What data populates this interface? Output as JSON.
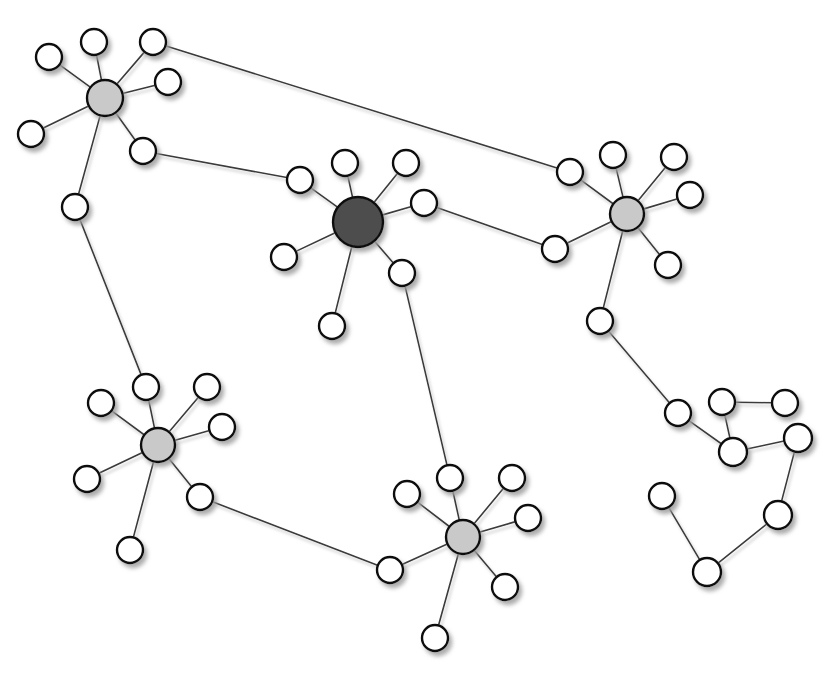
{
  "figure": {
    "background_color": "#ffffff",
    "width": 838,
    "height": 682
  },
  "style": {
    "edge_color": "#3a3a3a",
    "edge_width": 1.6,
    "node_stroke_color": "#111111",
    "node_stroke_width": 2.4,
    "leaf_fill": "#ffffff",
    "hub_light_fill": "#c9c9c9",
    "hub_dark_fill": "#4d4d4d",
    "shadow_color": "#bdbdbd"
  },
  "chart_data": {
    "type": "scatter",
    "xlabel": "",
    "ylabel": "",
    "xlim": [
      0,
      838
    ],
    "ylim": [
      0,
      682
    ],
    "grid": false,
    "legend": "none",
    "node_count": 57,
    "edge_count": 61,
    "node_classes": [
      {
        "name": "hub-dark",
        "count": 1,
        "radius": 25,
        "fill": "#4d4d4d"
      },
      {
        "name": "hub-light",
        "count": 4,
        "radius": 17,
        "fill": "#c9c9c9"
      },
      {
        "name": "leaf",
        "count": 52,
        "radius": 13,
        "fill": "#ffffff"
      }
    ],
    "nodes": [
      {
        "id": "h1",
        "label": "hub-top-left",
        "x": 105,
        "y": 98,
        "r": 18,
        "class": "hub-light"
      },
      {
        "id": "h1a",
        "label": "leaf",
        "x": 94,
        "y": 42,
        "r": 13,
        "class": "leaf"
      },
      {
        "id": "h1b",
        "label": "leaf",
        "x": 49,
        "y": 57,
        "r": 13,
        "class": "leaf"
      },
      {
        "id": "h1c",
        "label": "leaf",
        "x": 153,
        "y": 42,
        "r": 13,
        "class": "leaf"
      },
      {
        "id": "h1d",
        "label": "leaf",
        "x": 168,
        "y": 82,
        "r": 13,
        "class": "leaf"
      },
      {
        "id": "h1e",
        "label": "leaf",
        "x": 31,
        "y": 134,
        "r": 13,
        "class": "leaf"
      },
      {
        "id": "h1f",
        "label": "leaf",
        "x": 143,
        "y": 151,
        "r": 13,
        "class": "leaf"
      },
      {
        "id": "h1g",
        "label": "leaf",
        "x": 75,
        "y": 207,
        "r": 13,
        "class": "leaf"
      },
      {
        "id": "h2",
        "label": "hub-center-dark",
        "x": 358,
        "y": 222,
        "r": 25,
        "class": "hub-dark"
      },
      {
        "id": "h2a",
        "label": "leaf",
        "x": 300,
        "y": 180,
        "r": 13,
        "class": "leaf"
      },
      {
        "id": "h2b",
        "label": "leaf",
        "x": 345,
        "y": 163,
        "r": 13,
        "class": "leaf"
      },
      {
        "id": "h2c",
        "label": "leaf",
        "x": 406,
        "y": 163,
        "r": 13,
        "class": "leaf"
      },
      {
        "id": "h2d",
        "label": "leaf",
        "x": 424,
        "y": 203,
        "r": 13,
        "class": "leaf"
      },
      {
        "id": "h2e",
        "label": "leaf",
        "x": 284,
        "y": 257,
        "r": 13,
        "class": "leaf"
      },
      {
        "id": "h2f",
        "label": "leaf",
        "x": 402,
        "y": 273,
        "r": 13,
        "class": "leaf"
      },
      {
        "id": "h2g",
        "label": "leaf",
        "x": 332,
        "y": 326,
        "r": 13,
        "class": "leaf"
      },
      {
        "id": "h3",
        "label": "hub-right",
        "x": 627,
        "y": 214,
        "r": 17,
        "class": "hub-light"
      },
      {
        "id": "h3a",
        "label": "leaf",
        "x": 570,
        "y": 172,
        "r": 13,
        "class": "leaf"
      },
      {
        "id": "h3b",
        "label": "leaf",
        "x": 613,
        "y": 155,
        "r": 13,
        "class": "leaf"
      },
      {
        "id": "h3c",
        "label": "leaf",
        "x": 674,
        "y": 157,
        "r": 13,
        "class": "leaf"
      },
      {
        "id": "h3d",
        "label": "leaf",
        "x": 690,
        "y": 195,
        "r": 13,
        "class": "leaf"
      },
      {
        "id": "h3e",
        "label": "leaf",
        "x": 555,
        "y": 249,
        "r": 13,
        "class": "leaf"
      },
      {
        "id": "h3f",
        "label": "leaf",
        "x": 668,
        "y": 265,
        "r": 13,
        "class": "leaf"
      },
      {
        "id": "h3g",
        "label": "leaf",
        "x": 600,
        "y": 321,
        "r": 13,
        "class": "leaf"
      },
      {
        "id": "h4",
        "label": "hub-bottom-left",
        "x": 158,
        "y": 445,
        "r": 17,
        "class": "hub-light"
      },
      {
        "id": "h4a",
        "label": "leaf",
        "x": 101,
        "y": 403,
        "r": 13,
        "class": "leaf"
      },
      {
        "id": "h4b",
        "label": "leaf",
        "x": 146,
        "y": 387,
        "r": 13,
        "class": "leaf"
      },
      {
        "id": "h4c",
        "label": "leaf",
        "x": 207,
        "y": 387,
        "r": 13,
        "class": "leaf"
      },
      {
        "id": "h4d",
        "label": "leaf",
        "x": 222,
        "y": 427,
        "r": 13,
        "class": "leaf"
      },
      {
        "id": "h4e",
        "label": "leaf",
        "x": 87,
        "y": 479,
        "r": 13,
        "class": "leaf"
      },
      {
        "id": "h4f",
        "label": "leaf",
        "x": 200,
        "y": 497,
        "r": 13,
        "class": "leaf"
      },
      {
        "id": "h4g",
        "label": "leaf",
        "x": 130,
        "y": 550,
        "r": 13,
        "class": "leaf"
      },
      {
        "id": "h5",
        "label": "hub-bottom-center",
        "x": 463,
        "y": 537,
        "r": 17,
        "class": "hub-light"
      },
      {
        "id": "h5a",
        "label": "leaf",
        "x": 407,
        "y": 494,
        "r": 13,
        "class": "leaf"
      },
      {
        "id": "h5b",
        "label": "leaf",
        "x": 450,
        "y": 478,
        "r": 13,
        "class": "leaf"
      },
      {
        "id": "h5c",
        "label": "leaf",
        "x": 512,
        "y": 478,
        "r": 13,
        "class": "leaf"
      },
      {
        "id": "h5d",
        "label": "leaf",
        "x": 528,
        "y": 518,
        "r": 13,
        "class": "leaf"
      },
      {
        "id": "h5e",
        "label": "leaf",
        "x": 390,
        "y": 570,
        "r": 13,
        "class": "leaf"
      },
      {
        "id": "h5f",
        "label": "leaf",
        "x": 505,
        "y": 587,
        "r": 13,
        "class": "leaf"
      },
      {
        "id": "h5g",
        "label": "leaf",
        "x": 435,
        "y": 638,
        "r": 13,
        "class": "leaf"
      },
      {
        "id": "c1",
        "label": "chain-node",
        "x": 678,
        "y": 413,
        "r": 13,
        "class": "leaf"
      },
      {
        "id": "c2",
        "label": "chain-node",
        "x": 733,
        "y": 452,
        "r": 14,
        "class": "leaf"
      },
      {
        "id": "c3",
        "label": "chain-node",
        "x": 722,
        "y": 402,
        "r": 13,
        "class": "leaf"
      },
      {
        "id": "c4",
        "label": "chain-node",
        "x": 785,
        "y": 403,
        "r": 13,
        "class": "leaf"
      },
      {
        "id": "c5",
        "label": "chain-node",
        "x": 798,
        "y": 438,
        "r": 14,
        "class": "leaf"
      },
      {
        "id": "c6",
        "label": "chain-node",
        "x": 778,
        "y": 515,
        "r": 14,
        "class": "leaf"
      },
      {
        "id": "c7",
        "label": "chain-node",
        "x": 707,
        "y": 572,
        "r": 14,
        "class": "leaf"
      },
      {
        "id": "c8",
        "label": "chain-node",
        "x": 662,
        "y": 496,
        "r": 13,
        "class": "leaf"
      }
    ],
    "edges": [
      {
        "source": "h1",
        "target": "h1a",
        "kind": "spoke"
      },
      {
        "source": "h1",
        "target": "h1b",
        "kind": "spoke"
      },
      {
        "source": "h1",
        "target": "h1c",
        "kind": "spoke"
      },
      {
        "source": "h1",
        "target": "h1d",
        "kind": "spoke"
      },
      {
        "source": "h1",
        "target": "h1e",
        "kind": "spoke"
      },
      {
        "source": "h1",
        "target": "h1f",
        "kind": "spoke"
      },
      {
        "source": "h1",
        "target": "h1g",
        "kind": "spoke"
      },
      {
        "source": "h2",
        "target": "h2a",
        "kind": "spoke"
      },
      {
        "source": "h2",
        "target": "h2b",
        "kind": "spoke"
      },
      {
        "source": "h2",
        "target": "h2c",
        "kind": "spoke"
      },
      {
        "source": "h2",
        "target": "h2d",
        "kind": "spoke"
      },
      {
        "source": "h2",
        "target": "h2e",
        "kind": "spoke"
      },
      {
        "source": "h2",
        "target": "h2f",
        "kind": "spoke"
      },
      {
        "source": "h2",
        "target": "h2g",
        "kind": "spoke"
      },
      {
        "source": "h3",
        "target": "h3a",
        "kind": "spoke"
      },
      {
        "source": "h3",
        "target": "h3b",
        "kind": "spoke"
      },
      {
        "source": "h3",
        "target": "h3c",
        "kind": "spoke"
      },
      {
        "source": "h3",
        "target": "h3d",
        "kind": "spoke"
      },
      {
        "source": "h3",
        "target": "h3e",
        "kind": "spoke"
      },
      {
        "source": "h3",
        "target": "h3f",
        "kind": "spoke"
      },
      {
        "source": "h3",
        "target": "h3g",
        "kind": "spoke"
      },
      {
        "source": "h4",
        "target": "h4a",
        "kind": "spoke"
      },
      {
        "source": "h4",
        "target": "h4b",
        "kind": "spoke"
      },
      {
        "source": "h4",
        "target": "h4c",
        "kind": "spoke"
      },
      {
        "source": "h4",
        "target": "h4d",
        "kind": "spoke"
      },
      {
        "source": "h4",
        "target": "h4e",
        "kind": "spoke"
      },
      {
        "source": "h4",
        "target": "h4f",
        "kind": "spoke"
      },
      {
        "source": "h4",
        "target": "h4g",
        "kind": "spoke"
      },
      {
        "source": "h5",
        "target": "h5a",
        "kind": "spoke"
      },
      {
        "source": "h5",
        "target": "h5b",
        "kind": "spoke"
      },
      {
        "source": "h5",
        "target": "h5c",
        "kind": "spoke"
      },
      {
        "source": "h5",
        "target": "h5d",
        "kind": "spoke"
      },
      {
        "source": "h5",
        "target": "h5e",
        "kind": "spoke"
      },
      {
        "source": "h5",
        "target": "h5f",
        "kind": "spoke"
      },
      {
        "source": "h5",
        "target": "h5g",
        "kind": "spoke"
      },
      {
        "source": "h1c",
        "target": "h3a",
        "kind": "bridge"
      },
      {
        "source": "h1f",
        "target": "h2a",
        "kind": "bridge"
      },
      {
        "source": "h2d",
        "target": "h3e",
        "kind": "bridge"
      },
      {
        "source": "h1g",
        "target": "h4b",
        "kind": "bridge"
      },
      {
        "source": "h2f",
        "target": "h5b",
        "kind": "bridge"
      },
      {
        "source": "h4f",
        "target": "h5e",
        "kind": "bridge"
      },
      {
        "source": "h3g",
        "target": "c1",
        "kind": "bridge"
      },
      {
        "source": "c1",
        "target": "c2",
        "kind": "chain"
      },
      {
        "source": "c2",
        "target": "c3",
        "kind": "chain"
      },
      {
        "source": "c3",
        "target": "c4",
        "kind": "chain"
      },
      {
        "source": "c2",
        "target": "c5",
        "kind": "chain"
      },
      {
        "source": "c5",
        "target": "c6",
        "kind": "chain"
      },
      {
        "source": "c6",
        "target": "c7",
        "kind": "chain"
      },
      {
        "source": "c7",
        "target": "c8",
        "kind": "chain"
      }
    ]
  }
}
